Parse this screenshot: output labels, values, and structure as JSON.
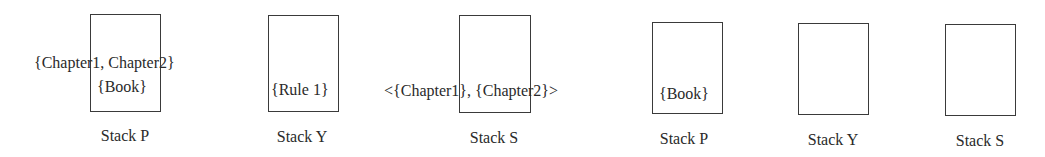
{
  "diagram": {
    "left_group": {
      "stacks": [
        {
          "label": "Stack P",
          "contents": [
            "{Chapter1, Chapter2}",
            "{Book}"
          ]
        },
        {
          "label": "Stack Y",
          "contents": [
            "{Rule 1}"
          ]
        },
        {
          "label": "Stack S",
          "contents": [
            "<{Chapter1}, {Chapter2}>"
          ]
        }
      ]
    },
    "right_group": {
      "stacks": [
        {
          "label": "Stack P",
          "contents": [
            "{Book}"
          ]
        },
        {
          "label": "Stack Y",
          "contents": []
        },
        {
          "label": "Stack S",
          "contents": []
        }
      ]
    }
  }
}
